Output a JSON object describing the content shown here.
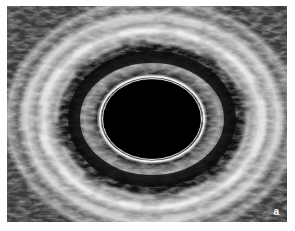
{
  "figure": {
    "type": "intravascular-ultrasound-cross-section",
    "panel_label": "a",
    "colors": {
      "background": "#ffffff",
      "lumen": "#000000",
      "tissue_bright": "#e8e8e8",
      "tissue_mid": "#7a7a7a",
      "tissue_dark": "#1e1e1e",
      "catheter_ring": "#f2f2f2"
    }
  }
}
